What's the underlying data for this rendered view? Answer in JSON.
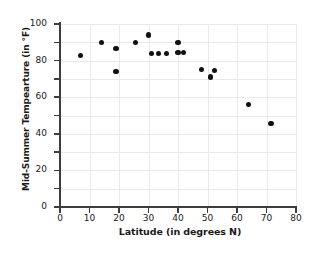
{
  "chart_data": {
    "type": "scatter",
    "title": "",
    "xlabel": "Latitude (in degrees N)",
    "ylabel": "Mid-Summer Tempearture (in °F)",
    "xlim": [
      0,
      80
    ],
    "ylim": [
      0,
      100
    ],
    "xticks": [
      0,
      10,
      20,
      30,
      40,
      50,
      60,
      70,
      80
    ],
    "yticks": [
      0,
      20,
      40,
      60,
      80,
      100
    ],
    "xtick_labels": [
      "0",
      "10",
      "20",
      "30",
      "40",
      "50",
      "60",
      "70",
      "80"
    ],
    "ytick_labels": [
      "0",
      "20",
      "40",
      "60",
      "80",
      "100"
    ],
    "grid": true,
    "grid_x_step": 10,
    "grid_y_step": 10,
    "legend": null,
    "marker": "filled-circle",
    "marker_color": "#111111",
    "points": [
      {
        "x": 7,
        "y": 83
      },
      {
        "x": 14,
        "y": 90
      },
      {
        "x": 19,
        "y": 86.5
      },
      {
        "x": 19,
        "y": 74
      },
      {
        "x": 25.5,
        "y": 90
      },
      {
        "x": 30,
        "y": 94
      },
      {
        "x": 31,
        "y": 84
      },
      {
        "x": 33.5,
        "y": 84
      },
      {
        "x": 36,
        "y": 84
      },
      {
        "x": 40,
        "y": 90
      },
      {
        "x": 40,
        "y": 84.5
      },
      {
        "x": 42,
        "y": 84.5
      },
      {
        "x": 48,
        "y": 75
      },
      {
        "x": 51,
        "y": 71
      },
      {
        "x": 52.5,
        "y": 74.5
      },
      {
        "x": 64,
        "y": 56
      },
      {
        "x": 71.5,
        "y": 45.5
      }
    ]
  },
  "colors": {
    "axis": "#3d3d3d",
    "grid": "#e9e9e9",
    "text": "#1a1a1a",
    "marker": "#111111",
    "background": "#ffffff"
  }
}
